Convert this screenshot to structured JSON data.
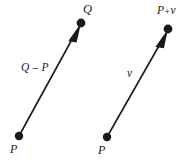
{
  "figure": {
    "kind": "vector-diagram",
    "background_color": "#ffffff",
    "ink_color": "#1a1a1a",
    "width": 194,
    "height": 163,
    "caption_present": false
  },
  "diagrams": [
    {
      "id": "left-diagram",
      "description": "Arrow from point P to point Q labeled Q - P",
      "tail_label": "P",
      "head_label": "Q",
      "vector_label": "Q – P",
      "tail_point": {
        "x": 19,
        "y": 136
      },
      "head_point": {
        "x": 81,
        "y": 23
      }
    },
    {
      "id": "right-diagram",
      "description": "Arrow from point P to point P + v labeled v",
      "tail_label": "P",
      "head_label_base": "P",
      "head_label_operator": "+",
      "head_label_addend": "v",
      "head_label": "P + v",
      "vector_label": "v",
      "tail_point": {
        "x": 107,
        "y": 137
      },
      "head_point": {
        "x": 168,
        "y": 29
      }
    }
  ],
  "labels": {
    "q_point": "Q",
    "q_minus_p": "Q – P",
    "p_left": "P",
    "p_plus_v_base": "P",
    "p_plus_v_op": "+",
    "p_plus_v_addend": "v",
    "v_vector": "v",
    "p_right": "P"
  },
  "geometry": {
    "dot_radius": 4.2,
    "line_width": 1.6,
    "arrowhead_length": 11,
    "arrowhead_half_width": 3.4
  },
  "colors": {
    "ink": "#1a1a1a",
    "background": "#ffffff"
  }
}
